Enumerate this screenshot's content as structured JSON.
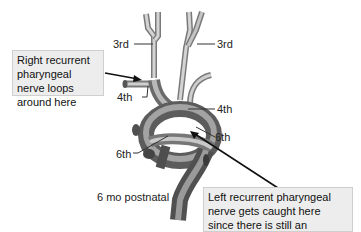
{
  "diagram": {
    "stage_label": "6 mo postnatal",
    "arch_labels": {
      "third_left": "3rd",
      "third_right": "3rd",
      "fourth_left": "4th",
      "fourth_right": "4th",
      "sixth_left": "6th",
      "sixth_right": "6th"
    },
    "callouts": {
      "right_nerve": "Right recurrent pharyngeal nerve loops around here",
      "left_nerve": "Left recurrent pharyngeal nerve gets caught here since there is still an attachment"
    },
    "colors": {
      "callout_bg": "#ededed",
      "vessel_light": "#d9d9d9",
      "vessel_mid": "#9a9a9a",
      "vessel_dark": "#5a5a5a",
      "line": "#222222"
    }
  }
}
